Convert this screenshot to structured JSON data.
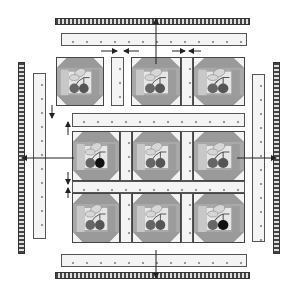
{
  "diagram": {
    "layout": {
      "block_rows": 3,
      "block_cols": 3
    },
    "blocks": [
      {
        "row": 1,
        "col": 1,
        "motif": "cherries",
        "cherry_colors": [
          "#666666",
          "#555555"
        ]
      },
      {
        "row": 1,
        "col": 2,
        "motif": "cherries",
        "cherry_colors": [
          "#666666",
          "#555555"
        ]
      },
      {
        "row": 1,
        "col": 3,
        "motif": "cherries",
        "cherry_colors": [
          "#666666",
          "#555555"
        ]
      },
      {
        "row": 2,
        "col": 1,
        "motif": "cherries",
        "cherry_colors": [
          "#666666",
          "#111111"
        ]
      },
      {
        "row": 2,
        "col": 2,
        "motif": "cherries",
        "cherry_colors": [
          "#666666",
          "#555555"
        ]
      },
      {
        "row": 2,
        "col": 3,
        "motif": "cherries",
        "cherry_colors": [
          "#666666",
          "#555555"
        ]
      },
      {
        "row": 3,
        "col": 1,
        "motif": "cherries",
        "cherry_colors": [
          "#666666",
          "#555555"
        ]
      },
      {
        "row": 3,
        "col": 2,
        "motif": "cherries",
        "cherry_colors": [
          "#666666",
          "#555555"
        ]
      },
      {
        "row": 3,
        "col": 3,
        "motif": "cherries",
        "cherry_colors": [
          "#666666",
          "#111111"
        ]
      }
    ],
    "components": [
      "binding",
      "border-sashing",
      "vertical-sashing",
      "horizontal-sashing",
      "blocks"
    ],
    "arrows": [
      "top-binding-up",
      "left-binding-left",
      "right-binding-right",
      "bottom-binding-down",
      "seam-press-left",
      "seam-press-right",
      "row-press-down",
      "row-press-up"
    ],
    "colors": {
      "leaf": "#d6d6d6",
      "corner_triangle": "#9a9a9a",
      "side_panel": "#a9a9a9",
      "center": "#e6e6e6",
      "stem": "#555555",
      "outline": "#444444"
    }
  }
}
